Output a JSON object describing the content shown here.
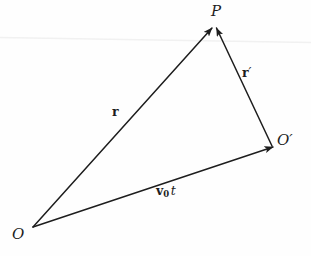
{
  "figure": {
    "kind": "vector-triangle-diagram",
    "background_color": "#fefefe",
    "stroke_color": "#1d1d1d",
    "artifact_color": "#f0f0f0",
    "width": 311,
    "height": 256
  },
  "points": {
    "P": {
      "label": "P",
      "x": 213,
      "y": 28
    },
    "O_prime": {
      "label": "O",
      "prime": "′",
      "x": 273,
      "y": 147
    },
    "O": {
      "label": "O",
      "x": 33,
      "y": 227
    }
  },
  "vectors": [
    {
      "name": "r",
      "label": "r",
      "from": "O",
      "to": "P",
      "x1": 33,
      "y1": 227,
      "x2": 212,
      "y2": 28,
      "label_x": 112,
      "label_y": 106
    },
    {
      "name": "r-prime",
      "label": "r",
      "prime": "′",
      "from": "O_prime",
      "to": "P",
      "x1": 272,
      "y1": 146,
      "x2": 216,
      "y2": 28,
      "label_x": 242,
      "label_y": 67
    },
    {
      "name": "v0t",
      "label": "v",
      "subscript": "0",
      "italic_suffix": "t",
      "from": "O",
      "to": "O_prime",
      "x1": 33,
      "y1": 227,
      "x2": 273,
      "y2": 147,
      "label_x": 156,
      "label_y": 185
    }
  ],
  "artifacts": {
    "scan_line": {
      "x1": 0,
      "y1": 37,
      "x2": 311,
      "y2": 42
    }
  }
}
